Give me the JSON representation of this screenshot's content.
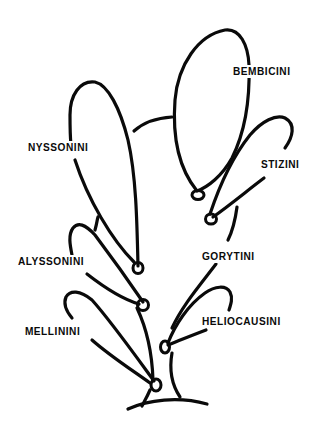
{
  "diagram": {
    "type": "phylogenetic-tree",
    "colors": {
      "line": "#0a0a0a",
      "background": "#ffffff"
    },
    "taxa": [
      {
        "id": "bembicini",
        "label": "BEMBICINI"
      },
      {
        "id": "stizini",
        "label": "STIZINI"
      },
      {
        "id": "nyssonini",
        "label": "NYSSONINI"
      },
      {
        "id": "gorytini",
        "label": "GORYTINI"
      },
      {
        "id": "alyssonini",
        "label": "ALYSSONINI"
      },
      {
        "id": "heliocausini",
        "label": "HELIOCAUSINI"
      },
      {
        "id": "mellinini",
        "label": "MELLININI"
      }
    ]
  }
}
